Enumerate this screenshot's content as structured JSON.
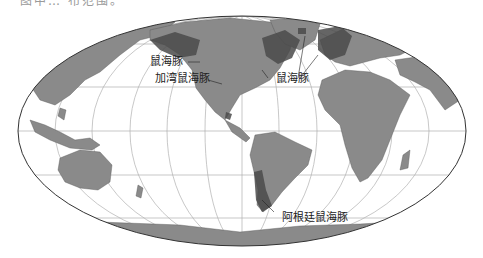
{
  "caption_fragment": "图中… 布范围。",
  "map": {
    "projection": "mollweide",
    "ocean_color": "#ffffff",
    "land_color": "#8a8a8a",
    "range_color": "#4a4a4a",
    "grid_color": "#b0b0b0",
    "outline_color": "#333333"
  },
  "labels": [
    {
      "id": "harbour-porpoise-pacific",
      "text": "鼠海豚"
    },
    {
      "id": "vaquita",
      "text": "加湾鼠海豚"
    },
    {
      "id": "harbour-porpoise-atlantic",
      "text": "鼠海豚"
    },
    {
      "id": "burmeister-porpoise",
      "text": "阿根廷鼠海豚"
    }
  ]
}
